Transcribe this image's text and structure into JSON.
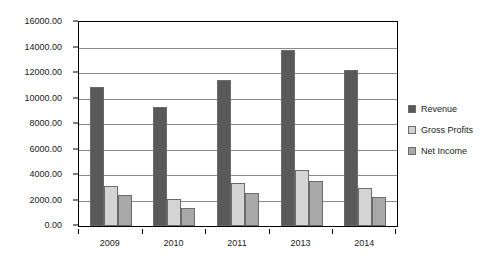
{
  "chart_data": {
    "type": "bar",
    "title": "",
    "subtitle": "",
    "xlabel": "",
    "ylabel": "",
    "categories": [
      "2009",
      "2010",
      "2011",
      "2013",
      "2014"
    ],
    "series": [
      {
        "name": "Revenue",
        "color": "#595959",
        "values": [
          10900,
          9300,
          11450,
          13800,
          12250
        ]
      },
      {
        "name": "Gross Profits",
        "color": "#d4d4d4",
        "values": [
          3100,
          2150,
          3350,
          4400,
          2950
        ]
      },
      {
        "name": "Net Income",
        "color": "#a8a8a8",
        "values": [
          2400,
          1400,
          2600,
          3500,
          2300
        ]
      }
    ],
    "ylim": [
      0,
      16000
    ],
    "ytick_step": 2000,
    "ytick_labels": [
      "0.00",
      "2000.00",
      "4000.00",
      "6000.00",
      "8000.00",
      "10000.00",
      "12000.00",
      "14000.00",
      "16000.00"
    ],
    "grid": true,
    "grid_axis": "y",
    "legend_position": "right",
    "bar_border_color": "#6b6b6b",
    "plot_border_color": "#000000",
    "gridline_color": "#8a8a8a",
    "background": "#ffffff"
  }
}
